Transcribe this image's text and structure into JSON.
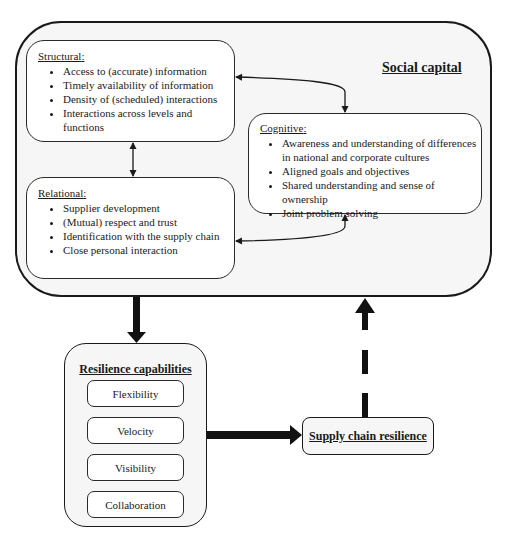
{
  "social_capital": {
    "title": "Social capital",
    "structural": {
      "title": "Structural",
      "items": [
        "Access to (accurate) information",
        "Timely availability of information",
        "Density of (scheduled) interactions",
        "Interactions across levels and functions"
      ]
    },
    "relational": {
      "title": "Relational",
      "items": [
        "Supplier development",
        "(Mutual) respect and trust",
        "Identification with the supply chain",
        "Close personal interaction"
      ]
    },
    "cognitive": {
      "title": "Cognitive",
      "items": [
        "Awareness and understanding of differences in national and corporate cultures",
        "Aligned goals and objectives",
        "Shared understanding and sense of ownership",
        "Joint problem solving"
      ]
    }
  },
  "resilience_capabilities": {
    "title": "Resilience capabilities",
    "items": [
      "Flexibility",
      "Velocity",
      "Visibility",
      "Collaboration"
    ]
  },
  "supply_chain_resilience": {
    "title": "Supply chain resilience"
  },
  "colon": ":"
}
